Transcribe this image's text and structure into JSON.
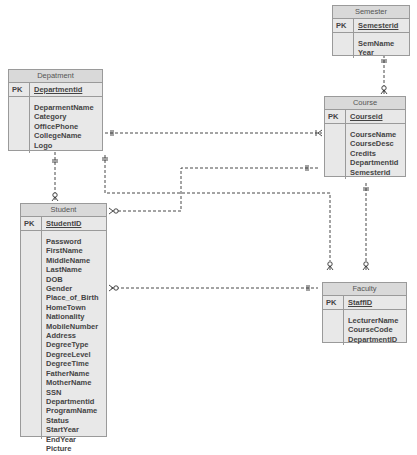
{
  "diagram": {
    "type": "entity-relationship",
    "entities": {
      "semester": {
        "title": "Semester",
        "pk_label": "PK",
        "pk": "Semesterid",
        "attributes": [
          "SemName",
          "Year"
        ]
      },
      "department": {
        "title": "Depatment",
        "pk_label": "PK",
        "pk": "Departmentid",
        "attributes": [
          "DeparmentName",
          "Category",
          "OfficePhone",
          "CollegeName",
          "Logo"
        ]
      },
      "course": {
        "title": "Course",
        "pk_label": "PK",
        "pk": "Courseid",
        "attributes": [
          "CourseName",
          "CourseDesc",
          "Credits",
          "Departmentid",
          "Semesterid"
        ]
      },
      "student": {
        "title": "Student",
        "pk_label": "PK",
        "pk": "StudentID",
        "attributes": [
          "Password",
          "FirstName",
          "MiddleName",
          "LastName",
          "DOB",
          "Gender",
          "Place_of_Birth",
          "HomeTown",
          "Nationality",
          "MobileNumber",
          "Address",
          "DegreeType",
          "DegreeLevel",
          "DegreeTime",
          "FatherName",
          "MotherName",
          "SSN",
          "Departmentid",
          "ProgramName",
          "Status",
          "StartYear",
          "EndYear",
          "Picture"
        ]
      },
      "faculty": {
        "title": "Faculty",
        "pk_label": "PK",
        "pk": "StaffID",
        "attributes": [
          "LecturerName",
          "CourseCode",
          "DepartmentID"
        ]
      }
    },
    "relationships": [
      {
        "from": "Semester",
        "to": "Course",
        "from_card": "one-and-only-one",
        "to_card": "zero-or-many"
      },
      {
        "from": "Depatment",
        "to": "Course",
        "from_card": "one-and-only-one",
        "to_card": "one-or-many"
      },
      {
        "from": "Depatment",
        "to": "Student",
        "from_card": "one-and-only-one",
        "to_card": "zero-or-many"
      },
      {
        "from": "Depatment",
        "to": "Faculty",
        "from_card": "one-and-only-one",
        "to_card": "zero-or-many"
      },
      {
        "from": "Course",
        "to": "Student",
        "from_card": "one-and-only-one",
        "to_card": "zero-or-many"
      },
      {
        "from": "Course",
        "to": "Faculty",
        "from_card": "one-and-only-one",
        "to_card": "zero-or-many"
      },
      {
        "from": "Faculty",
        "to": "Student",
        "from_card": "one-and-only-one",
        "to_card": "zero-or-many"
      }
    ]
  }
}
